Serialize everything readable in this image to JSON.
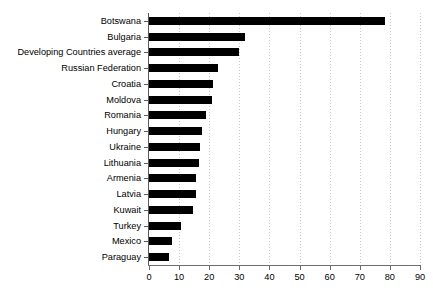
{
  "chart_data": {
    "type": "bar",
    "orientation": "horizontal",
    "title": "",
    "xlabel": "",
    "ylabel": "",
    "xlim": [
      0,
      90
    ],
    "xticks": [
      0,
      10,
      20,
      30,
      40,
      50,
      60,
      70,
      80,
      90
    ],
    "grid": "vertical-dotted",
    "legend": "none",
    "bar_color": "#000000",
    "categories": [
      "Botswana",
      "Bulgaria",
      "Developing Countries average",
      "Russian Federation",
      "Croatia",
      "Moldova",
      "Romania",
      "Hungary",
      "Ukraine",
      "Lithuania",
      "Armenia",
      "Latvia",
      "Kuwait",
      "Turkey",
      "Mexico",
      "Paraguay"
    ],
    "values": [
      78.5,
      32,
      29.8,
      23,
      21.2,
      21,
      19,
      17.5,
      17,
      16.5,
      15.5,
      15.5,
      14.5,
      10.5,
      7.8,
      6.6
    ]
  }
}
